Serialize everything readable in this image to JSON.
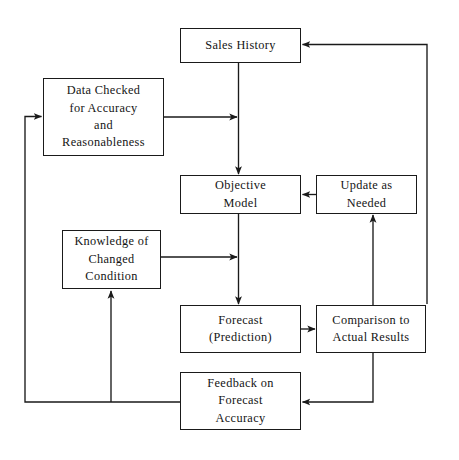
{
  "diagram": {
    "type": "flowchart",
    "background_color": "#ffffff",
    "line_color": "#1a1a1a",
    "text_color": "#141414",
    "nodes": [
      {
        "id": "sales-history",
        "label": "Sales History",
        "x": 180,
        "y": 28,
        "w": 121,
        "h": 35
      },
      {
        "id": "data-checked",
        "label": "Data Checked\nfor Accuracy\nand\nReasonableness",
        "x": 43,
        "y": 78,
        "w": 121,
        "h": 78
      },
      {
        "id": "objective-model",
        "label": "Objective\nModel",
        "x": 180,
        "y": 175,
        "w": 121,
        "h": 39
      },
      {
        "id": "update-as-needed",
        "label": "Update as\nNeeded",
        "x": 316,
        "y": 175,
        "w": 101,
        "h": 39
      },
      {
        "id": "knowledge-changed-condition",
        "label": "Knowledge of\nChanged\nCondition",
        "x": 62,
        "y": 230,
        "w": 99,
        "h": 59
      },
      {
        "id": "forecast-prediction",
        "label": "Forecast\n(Prediction)",
        "x": 180,
        "y": 305,
        "w": 121,
        "h": 48
      },
      {
        "id": "comparison-actual-results",
        "label": "Comparison to\nActual Results",
        "x": 316,
        "y": 305,
        "w": 110,
        "h": 48
      },
      {
        "id": "feedback-forecast-accuracy",
        "label": "Feedback on\nForecast\nAccuracy",
        "x": 180,
        "y": 372,
        "w": 121,
        "h": 58
      }
    ],
    "edges": [
      {
        "id": "sales-history-to-objective-model",
        "from": "sales-history",
        "to": "objective-model",
        "arrow": "down"
      },
      {
        "id": "data-checked-to-trunk",
        "from": "data-checked",
        "to": "objective-model",
        "arrow": "right"
      },
      {
        "id": "update-as-needed-to-objective-model",
        "from": "update-as-needed",
        "to": "objective-model",
        "arrow": "left"
      },
      {
        "id": "objective-model-to-forecast",
        "from": "objective-model",
        "to": "forecast-prediction",
        "arrow": "down"
      },
      {
        "id": "knowledge-to-trunk",
        "from": "knowledge-changed-condition",
        "to": "forecast-prediction",
        "arrow": "right"
      },
      {
        "id": "forecast-to-comparison",
        "from": "forecast-prediction",
        "to": "comparison-actual-results",
        "arrow": "right"
      },
      {
        "id": "comparison-to-update-as-needed",
        "from": "comparison-actual-results",
        "to": "update-as-needed",
        "arrow": "up"
      },
      {
        "id": "comparison-to-feedback",
        "from": "comparison-actual-results",
        "to": "feedback-forecast-accuracy",
        "arrow": "left"
      },
      {
        "id": "comparison-to-sales-history",
        "from": "comparison-actual-results",
        "to": "sales-history",
        "arrow": "left"
      },
      {
        "id": "feedback-to-data-checked",
        "from": "feedback-forecast-accuracy",
        "to": "data-checked",
        "arrow": "right"
      },
      {
        "id": "feedback-to-knowledge",
        "from": "feedback-forecast-accuracy",
        "to": "knowledge-changed-condition",
        "arrow": "up"
      }
    ]
  }
}
